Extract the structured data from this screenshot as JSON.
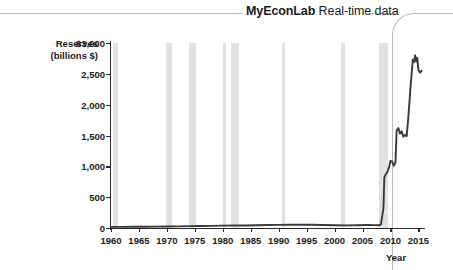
{
  "header": {
    "brand": "MyEconLab",
    "subtitle": " Real-time data"
  },
  "chart_data": {
    "type": "line",
    "title": "",
    "xlabel": "Year",
    "ylabel": "Reserves (billions $)",
    "ylabel_line1": "Reserves",
    "ylabel_line2": "(billions $)",
    "xlim": [
      1960,
      2016
    ],
    "ylim": [
      0,
      3000
    ],
    "grid": false,
    "legend": null,
    "y_ticks": [
      0,
      500,
      1000,
      1500,
      2000,
      2500,
      3000
    ],
    "y_ticklabels": [
      "0",
      "500",
      "1,000",
      "1,500",
      "2,000",
      "2,500",
      "$3,000"
    ],
    "x_ticks": [
      1960,
      1965,
      1970,
      1975,
      1980,
      1985,
      1990,
      1995,
      2000,
      2005,
      2010,
      2015
    ],
    "x_ticklabels": [
      "1960",
      "1965",
      "1970",
      "1975",
      "1980",
      "1985",
      "1990",
      "1995",
      "2000",
      "2005",
      "2010",
      "2015"
    ],
    "line_color": "#3a3a3a",
    "band_color": "#e2e2e2",
    "recession_bands": [
      {
        "start": 1960.3,
        "end": 1961.2
      },
      {
        "start": 1969.9,
        "end": 1970.9
      },
      {
        "start": 1973.9,
        "end": 1975.2
      },
      {
        "start": 1980.0,
        "end": 1980.6
      },
      {
        "start": 1981.5,
        "end": 1982.9
      },
      {
        "start": 1990.6,
        "end": 1991.2
      },
      {
        "start": 2001.2,
        "end": 2001.9
      },
      {
        "start": 2007.9,
        "end": 2009.5
      }
    ],
    "series": [
      {
        "name": "Reserves",
        "x": [
          1960,
          1962,
          1964,
          1966,
          1968,
          1970,
          1972,
          1974,
          1976,
          1978,
          1980,
          1982,
          1984,
          1986,
          1988,
          1990,
          1992,
          1994,
          1996,
          1998,
          2000,
          2002,
          2004,
          2006,
          2007,
          2008.0,
          2008.3,
          2008.75,
          2008.9,
          2009.1,
          2009.4,
          2009.8,
          2010.0,
          2010.3,
          2010.6,
          2010.9,
          2011.1,
          2011.4,
          2011.7,
          2012.0,
          2012.3,
          2012.6,
          2012.9,
          2013.2,
          2013.6,
          2014.0,
          2014.2,
          2014.4,
          2014.6,
          2014.8,
          2015.0,
          2015.3,
          2015.6
        ],
        "y": [
          18,
          19,
          20,
          21,
          23,
          25,
          27,
          30,
          32,
          35,
          38,
          40,
          41,
          45,
          48,
          50,
          52,
          55,
          52,
          48,
          45,
          42,
          45,
          48,
          46,
          45,
          60,
          330,
          820,
          860,
          900,
          1000,
          1090,
          1080,
          1010,
          1060,
          1580,
          1620,
          1530,
          1570,
          1480,
          1510,
          1490,
          1800,
          2300,
          2730,
          2690,
          2800,
          2700,
          2760,
          2560,
          2520,
          2550
        ]
      }
    ],
    "annotations": [
      "Flat near zero from 1960 to 2008, then a sharp rise after the 2008-09 recession."
    ]
  }
}
